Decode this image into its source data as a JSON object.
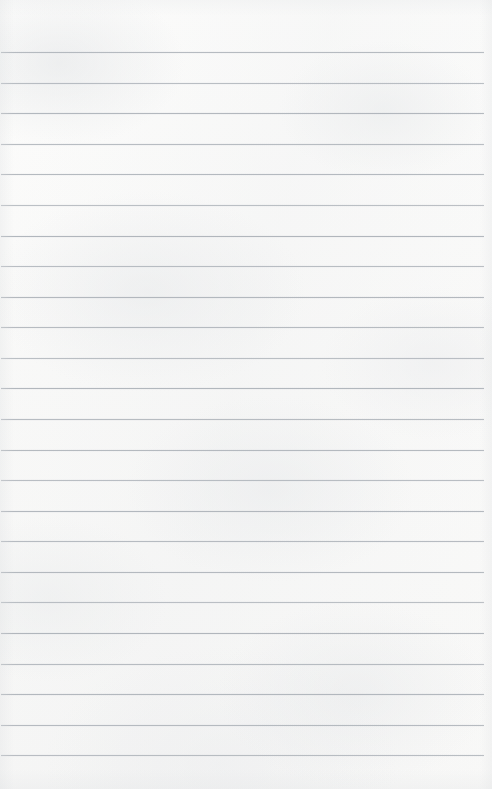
{
  "document": {
    "kind": "lined-notebook-page",
    "title": "Blank Ruled Notebook Page",
    "text_content": "",
    "has_handwriting": false,
    "has_printed_text": false
  },
  "page": {
    "width": 492,
    "height": 789,
    "background_color": "#fbfbfa",
    "paper_tone": "off-white scanned paper with faint mottled texture",
    "orientation": "portrait"
  },
  "ruling": {
    "style": "horizontal-ruled",
    "line_color": "#a8aeb5",
    "line_thickness": 1,
    "line_count": 24,
    "first_line_y": 52,
    "last_line_y": 755,
    "line_spacing": 30.6,
    "line_start_x": 1,
    "line_end_x": 484,
    "top_margin": 52,
    "bottom_margin": 34,
    "left_margin": 1,
    "right_margin": 8,
    "has_vertical_margin_rule": false
  },
  "lines": [
    {
      "index": 1,
      "y": 52,
      "opacity": 0.82
    },
    {
      "index": 2,
      "y": 83,
      "opacity": 0.78
    },
    {
      "index": 3,
      "y": 113,
      "opacity": 0.86
    },
    {
      "index": 4,
      "y": 144,
      "opacity": 0.8
    },
    {
      "index": 5,
      "y": 174,
      "opacity": 0.84
    },
    {
      "index": 6,
      "y": 205,
      "opacity": 0.76
    },
    {
      "index": 7,
      "y": 236,
      "opacity": 0.88
    },
    {
      "index": 8,
      "y": 266,
      "opacity": 0.79
    },
    {
      "index": 9,
      "y": 297,
      "opacity": 0.85
    },
    {
      "index": 10,
      "y": 327,
      "opacity": 0.81
    },
    {
      "index": 11,
      "y": 358,
      "opacity": 0.77
    },
    {
      "index": 12,
      "y": 388,
      "opacity": 0.87
    },
    {
      "index": 13,
      "y": 419,
      "opacity": 0.8
    },
    {
      "index": 14,
      "y": 450,
      "opacity": 0.83
    },
    {
      "index": 15,
      "y": 480,
      "opacity": 0.78
    },
    {
      "index": 16,
      "y": 511,
      "opacity": 0.86
    },
    {
      "index": 17,
      "y": 541,
      "opacity": 0.81
    },
    {
      "index": 18,
      "y": 572,
      "opacity": 0.84
    },
    {
      "index": 19,
      "y": 602,
      "opacity": 0.76
    },
    {
      "index": 20,
      "y": 633,
      "opacity": 0.88
    },
    {
      "index": 21,
      "y": 664,
      "opacity": 0.8
    },
    {
      "index": 22,
      "y": 694,
      "opacity": 0.85
    },
    {
      "index": 23,
      "y": 725,
      "opacity": 0.82
    },
    {
      "index": 24,
      "y": 755,
      "opacity": 0.79
    }
  ]
}
